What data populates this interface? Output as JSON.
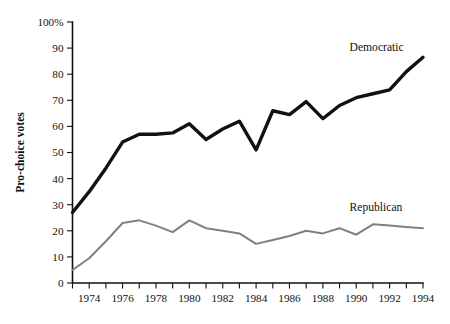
{
  "chart_data": {
    "type": "line",
    "title": "",
    "subtitle": "",
    "xlabel": "",
    "ylabel": "Pro-choice votes",
    "xlim": [
      1973,
      1994
    ],
    "ylim": [
      0,
      100
    ],
    "grid": false,
    "legend_position": "inline-right",
    "x": [
      1973,
      1974,
      1975,
      1976,
      1977,
      1978,
      1979,
      1980,
      1981,
      1982,
      1983,
      1984,
      1985,
      1986,
      1987,
      1988,
      1989,
      1990,
      1991,
      1992,
      1993,
      1994
    ],
    "x_tick_values": [
      1973,
      1974,
      1975,
      1976,
      1977,
      1978,
      1979,
      1980,
      1981,
      1982,
      1983,
      1984,
      1985,
      1986,
      1987,
      1988,
      1989,
      1990,
      1991,
      1992,
      1993,
      1994
    ],
    "x_tick_labels": [
      "",
      "1974",
      "",
      "1976",
      "",
      "1978",
      "",
      "1980",
      "",
      "1982",
      "",
      "1984",
      "",
      "1986",
      "",
      "1988",
      "",
      "1990",
      "",
      "1992",
      "",
      "1994"
    ],
    "y_tick_values": [
      0,
      10,
      20,
      30,
      40,
      50,
      60,
      70,
      80,
      90,
      100
    ],
    "y_tick_labels": [
      "0",
      "10",
      "20",
      "30",
      "40",
      "50",
      "60",
      "70",
      "80",
      "90",
      "100%"
    ],
    "series": [
      {
        "name": "Democratic",
        "color": "#111111",
        "line_width": 3.4,
        "label_x": 1989.6,
        "label_y": 89,
        "values": [
          27,
          35,
          44,
          54,
          57,
          57,
          57.5,
          61,
          55,
          59,
          62,
          51,
          66,
          64.5,
          69.5,
          63,
          68,
          71,
          72.5,
          74,
          81,
          86.5
        ]
      },
      {
        "name": "Republican",
        "color": "#808080",
        "line_width": 2.0,
        "label_x": 1989.6,
        "label_y": 27.5,
        "values": [
          5,
          9.5,
          16,
          23,
          24,
          22,
          19.5,
          24,
          21,
          20,
          19,
          15,
          16.5,
          18,
          20,
          19,
          21,
          18.5,
          22.5,
          22,
          21.5,
          21
        ]
      }
    ]
  }
}
